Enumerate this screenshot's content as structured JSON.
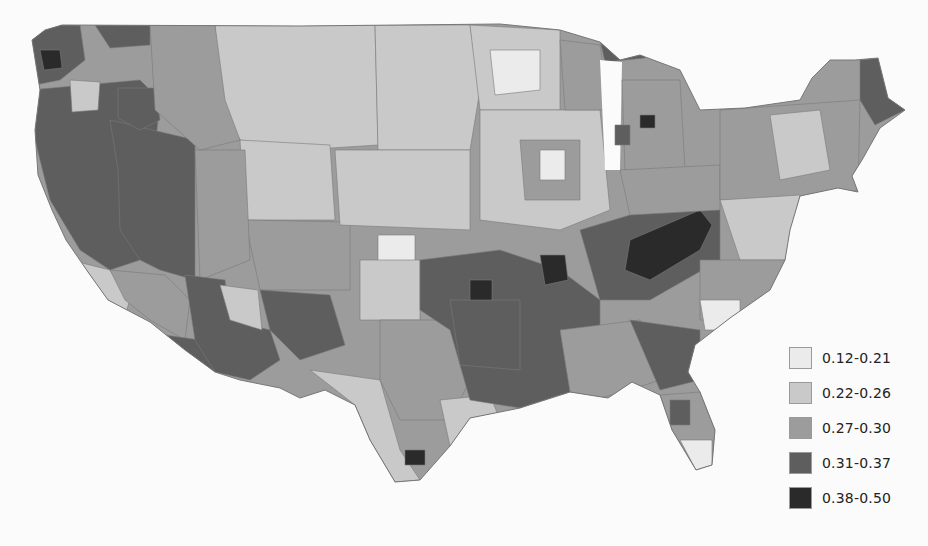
{
  "map": {
    "subject": "Choropleth map of the contiguous United States by county/region",
    "classes": [
      {
        "id": "c1",
        "label": "0.12-0.21",
        "color": "#ebebeb"
      },
      {
        "id": "c2",
        "label": "0.22-0.26",
        "color": "#c9c9c9"
      },
      {
        "id": "c3",
        "label": "0.27-0.30",
        "color": "#9c9c9c"
      },
      {
        "id": "c4",
        "label": "0.31-0.37",
        "color": "#5e5e5e"
      },
      {
        "id": "c5",
        "label": "0.38-0.50",
        "color": "#2a2a2a"
      }
    ],
    "background": "#fbfbfb",
    "border_color": "#7a7a7a"
  },
  "legend": {
    "items": [
      {
        "label": "0.12-0.21",
        "color": "#ebebeb"
      },
      {
        "label": "0.22-0.26",
        "color": "#c9c9c9"
      },
      {
        "label": "0.27-0.30",
        "color": "#9c9c9c"
      },
      {
        "label": "0.31-0.37",
        "color": "#5e5e5e"
      },
      {
        "label": "0.38-0.50",
        "color": "#2a2a2a"
      }
    ]
  }
}
